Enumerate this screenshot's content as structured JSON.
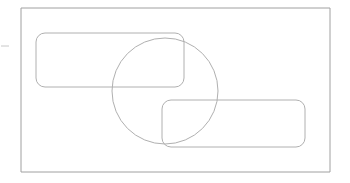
{
  "canvas": {
    "width": 350,
    "height": 183,
    "background_color": "#ffffff"
  },
  "diagram": {
    "title": "",
    "stroke_color": "#a8a8a8",
    "stroke_color_light": "#b9b9b9",
    "stroke_width": 1,
    "fill": "none"
  },
  "shapes": {
    "outer_frame": {
      "name": "outer-frame",
      "type": "rectangle",
      "x": 21,
      "y": 8,
      "width": 309,
      "height": 164,
      "rx": 0,
      "stroke": "#a0a0a0"
    },
    "upper_rounded_rect": {
      "name": "upper-rounded-rectangle",
      "type": "rounded-rectangle",
      "x": 36,
      "y": 33,
      "width": 148,
      "height": 54,
      "rx": 9,
      "stroke": "#b0b0b0"
    },
    "lower_rounded_rect": {
      "name": "lower-rounded-rectangle",
      "type": "rounded-rectangle",
      "x": 162,
      "y": 100,
      "width": 143,
      "height": 47,
      "rx": 9,
      "stroke": "#b0b0b0"
    },
    "circle": {
      "name": "overlay-circle",
      "type": "circle",
      "cx": 165,
      "cy": 91,
      "r": 53,
      "stroke": "#b0b0b0"
    },
    "left_tick": {
      "name": "left-edge-tick-mark",
      "type": "line",
      "x1": 1,
      "y1": 46,
      "x2": 9,
      "y2": 46,
      "stroke": "#c8c8c8"
    }
  }
}
